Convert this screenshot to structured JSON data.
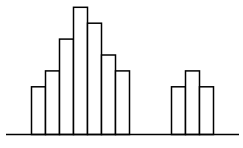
{
  "chart_data": {
    "type": "bar",
    "title": "",
    "xlabel": "",
    "ylabel": "",
    "grid": false,
    "legend": null,
    "categories": [
      "1",
      "2",
      "3",
      "4",
      "5",
      "6",
      "7",
      "8",
      "9",
      "10",
      "11",
      "12",
      "13",
      "14"
    ],
    "values": [
      3,
      4,
      6,
      8,
      7,
      5,
      4,
      0,
      0,
      0,
      3,
      4,
      3,
      0
    ],
    "ylim": [
      0,
      8
    ],
    "colors": {
      "bar_fill": "#ffffff",
      "bar_stroke": "#000000",
      "axis": "#000000"
    }
  }
}
